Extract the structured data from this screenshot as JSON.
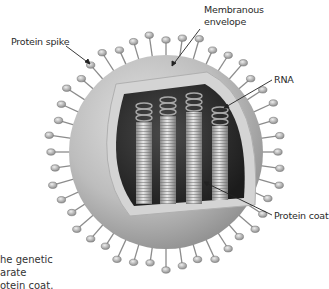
{
  "figure": {
    "labels": {
      "protein_spike": "Protein spike",
      "membranous_envelope_line1": "Membranous",
      "membranous_envelope_line2": "envelope",
      "rna": "RNA",
      "protein_coat": "Protein coat"
    },
    "caption_lines": [
      "he genetic",
      "arate",
      "otein coat."
    ],
    "colors": {
      "background": "#ffffff",
      "envelope": "#b8b8b8",
      "envelope_rim": "#d6d6d6",
      "interior": "#2e2e2e",
      "rod": "#c9c9c9",
      "spike": "#9a9a9a",
      "label_text": "#2a2a2a",
      "leader_line": "#222222"
    }
  }
}
